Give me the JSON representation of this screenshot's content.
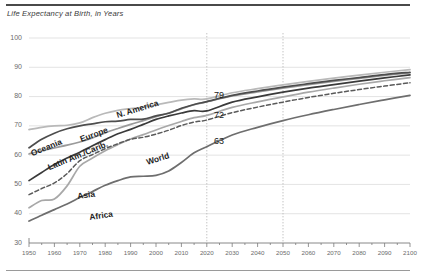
{
  "chart_data": {
    "type": "line",
    "title": "Life Expectancy at Birth, in Years",
    "xlabel": "",
    "ylabel": "",
    "xlim": [
      1950,
      2100
    ],
    "ylim": [
      30,
      100
    ],
    "yticks": [
      30,
      40,
      50,
      60,
      70,
      80,
      90,
      100
    ],
    "xticks": [
      1950,
      1960,
      1970,
      1980,
      1990,
      2000,
      2010,
      2020,
      2030,
      2040,
      2050,
      2060,
      2070,
      2080,
      2090,
      2100
    ],
    "minor_xtick_step": 5,
    "grid": "horizontal",
    "legend_position": "inline-labels",
    "reference_lines": [
      2020,
      2050
    ],
    "annotations": [
      {
        "text": "79",
        "x": 2022,
        "y": 79
      },
      {
        "text": "72",
        "x": 2022,
        "y": 72
      },
      {
        "text": "63",
        "x": 2022,
        "y": 63
      }
    ],
    "x": [
      1950,
      1955,
      1960,
      1965,
      1970,
      1975,
      1980,
      1985,
      1990,
      1995,
      2000,
      2005,
      2010,
      2015,
      2020,
      2030,
      2040,
      2050,
      2060,
      2070,
      2080,
      2090,
      2100
    ],
    "series": [
      {
        "name": "N. America",
        "style": "solid",
        "color": "#b9b9b9",
        "values": [
          68.7,
          69.5,
          70.0,
          70.2,
          71.0,
          72.8,
          74.3,
          75.3,
          75.9,
          76.4,
          77.2,
          78.0,
          78.8,
          79.2,
          79.2,
          81.3,
          82.7,
          84.0,
          85.2,
          86.3,
          87.3,
          88.3,
          89.2
        ]
      },
      {
        "name": "Oceania",
        "style": "solid",
        "color": "#9a9a9a",
        "values": [
          60.4,
          61.5,
          62.5,
          63.4,
          64.5,
          65.9,
          67.6,
          69.1,
          70.5,
          71.8,
          73.1,
          74.4,
          75.8,
          77.2,
          78.2,
          80.2,
          81.6,
          82.9,
          84.1,
          85.2,
          86.2,
          87.2,
          88.1
        ]
      },
      {
        "name": "Europe",
        "style": "solid",
        "color": "#4d4d4d",
        "values": [
          62.5,
          65.4,
          67.5,
          69.0,
          70.0,
          70.7,
          71.4,
          71.6,
          72.2,
          72.3,
          73.4,
          74.3,
          76.0,
          77.3,
          78.3,
          80.4,
          81.9,
          83.2,
          84.4,
          85.5,
          86.5,
          87.5,
          88.3
        ]
      },
      {
        "name": "Latin Am./Carib.",
        "style": "solid",
        "color": "#3a3a3a",
        "values": [
          51.3,
          54.1,
          56.8,
          59.0,
          61.0,
          63.2,
          65.3,
          67.3,
          68.8,
          70.5,
          72.2,
          73.4,
          74.4,
          75.2,
          75.1,
          78.1,
          79.9,
          81.5,
          82.9,
          84.1,
          85.3,
          86.4,
          87.4
        ]
      },
      {
        "name": "Asia",
        "style": "solid",
        "color": "#a8a8a8",
        "values": [
          42.0,
          44.5,
          45.0,
          49.5,
          56.2,
          59.0,
          61.5,
          63.6,
          65.5,
          67.0,
          68.6,
          70.1,
          71.5,
          72.8,
          73.6,
          76.3,
          78.2,
          79.9,
          81.5,
          82.9,
          84.2,
          85.4,
          86.5
        ]
      },
      {
        "name": "World",
        "style": "dashed",
        "color": "#5a5a5a",
        "values": [
          46.5,
          48.6,
          50.5,
          53.7,
          58.1,
          60.2,
          62.2,
          63.9,
          65.4,
          66.1,
          67.2,
          68.5,
          70.1,
          71.3,
          72.0,
          74.5,
          76.4,
          78.1,
          79.7,
          81.1,
          82.4,
          83.6,
          84.7
        ]
      },
      {
        "name": "Africa",
        "style": "solid",
        "color": "#6e6e6e",
        "values": [
          37.5,
          39.5,
          41.4,
          43.3,
          45.5,
          47.6,
          49.7,
          51.3,
          52.6,
          52.8,
          53.1,
          54.6,
          57.5,
          60.8,
          62.9,
          66.9,
          69.5,
          71.8,
          73.8,
          75.6,
          77.3,
          78.9,
          80.4
        ]
      }
    ],
    "series_label_positions": [
      {
        "name": "Oceania",
        "x": 33,
        "y": 148,
        "rotation": -22
      },
      {
        "name": "Europe",
        "x": 82,
        "y": 134,
        "rotation": -20
      },
      {
        "name": "N. America",
        "x": 118,
        "y": 110,
        "rotation": -17
      },
      {
        "name": "Latin Am./Carib.",
        "x": 50,
        "y": 162,
        "rotation": -22
      },
      {
        "name": "World",
        "x": 148,
        "y": 157,
        "rotation": -18
      },
      {
        "name": "Asia",
        "x": 78,
        "y": 191,
        "rotation": -8
      },
      {
        "name": "Africa",
        "x": 90,
        "y": 212,
        "rotation": -8
      }
    ]
  }
}
